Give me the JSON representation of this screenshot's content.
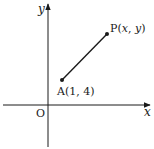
{
  "diagram": {
    "axes": {
      "x_label": "x",
      "y_label": "y",
      "origin_label": "O"
    },
    "points": [
      {
        "name": "A",
        "label": "A(1, 4)"
      },
      {
        "name": "P",
        "label_prefix": "P",
        "label_open": "(",
        "label_x": "x",
        "label_sep": ", ",
        "label_y": "y",
        "label_close": ")"
      }
    ],
    "segment": {
      "from": "A",
      "to": "P"
    },
    "colors": {
      "stroke": "#1a1a1a",
      "background": "#ffffff"
    }
  }
}
